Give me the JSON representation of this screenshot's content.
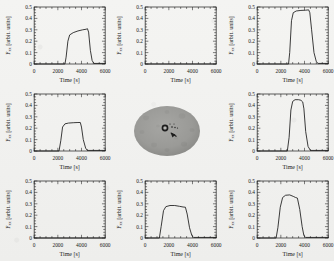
{
  "figure": {
    "kind": "3x3 grid of time-series plots with sample photograph in center",
    "background_color": "#f2f2f0",
    "line_color": "#1a1a1a"
  },
  "axes": {
    "xlabel": "Time [s]",
    "ylabel": "F",
    "ylabel_sub": "xx",
    "ylabel_units": "[arbit. units]",
    "xticks": [
      "0",
      "2000",
      "4000",
      "6000"
    ],
    "yticks": [
      "0",
      "0.1",
      "0.2",
      "0.3",
      "0.4",
      "0.5"
    ],
    "xlim": [
      0,
      6000
    ],
    "ylim": [
      0,
      0.5
    ]
  },
  "sample": {
    "name": "sample-photograph",
    "shape": "ellipse",
    "fill_color": "#9a9a98",
    "marker_color": "#1d1d1d",
    "features": [
      "center-ring",
      "dark-arrow",
      "small-dots"
    ]
  },
  "chart_data": [
    {
      "id": "panel-top-left",
      "position": "row1-col1",
      "type": "line",
      "title": "",
      "xlabel": "Time [s]",
      "ylabel": "F_xx [arbit. units]",
      "xlim": [
        0,
        6000
      ],
      "ylim": [
        0,
        0.5
      ],
      "grid": false,
      "x": [
        0,
        2600,
        2700,
        2850,
        3000,
        3300,
        3700,
        4100,
        4400,
        4500,
        4600,
        4750,
        4900,
        5050,
        6000
      ],
      "y": [
        0,
        0,
        0.06,
        0.2,
        0.255,
        0.275,
        0.29,
        0.3,
        0.305,
        0.31,
        0.28,
        0.12,
        0.03,
        0.005,
        0.005
      ]
    },
    {
      "id": "panel-top-center",
      "position": "row1-col2",
      "type": "line",
      "title": "",
      "xlabel": "Time [s]",
      "ylabel": "F_xx [arbit. units]",
      "xlim": [
        0,
        6000
      ],
      "ylim": [
        0,
        0.5
      ],
      "grid": false,
      "x": [
        0,
        6000
      ],
      "y": [
        0,
        0
      ]
    },
    {
      "id": "panel-top-right",
      "position": "row1-col3",
      "type": "line",
      "title": "",
      "xlabel": "Time [s]",
      "ylabel": "F_xx [arbit. units]",
      "xlim": [
        0,
        6000
      ],
      "ylim": [
        0,
        0.5
      ],
      "grid": false,
      "x": [
        0,
        2650,
        2750,
        2900,
        3050,
        3300,
        3700,
        4100,
        4350,
        4450,
        4600,
        4800,
        5000,
        5150,
        6000
      ],
      "y": [
        0,
        0,
        0.1,
        0.38,
        0.45,
        0.465,
        0.47,
        0.472,
        0.475,
        0.45,
        0.3,
        0.1,
        0.02,
        0.005,
        0.005
      ]
    },
    {
      "id": "panel-middle-left",
      "position": "row2-col1",
      "type": "line",
      "title": "",
      "xlabel": "Time [s]",
      "ylabel": "F_xx [arbit. units]",
      "xlim": [
        0,
        6000
      ],
      "ylim": [
        0,
        0.5
      ],
      "grid": false,
      "x": [
        0,
        2100,
        2250,
        2400,
        2600,
        2900,
        3300,
        3700,
        3900,
        4000,
        4150,
        4350,
        4500,
        6000
      ],
      "y": [
        0,
        0,
        0.09,
        0.21,
        0.238,
        0.245,
        0.248,
        0.25,
        0.25,
        0.21,
        0.1,
        0.025,
        0.005,
        0.005
      ]
    },
    {
      "id": "panel-middle-center",
      "position": "row2-col2",
      "type": "image",
      "title": "sample photograph"
    },
    {
      "id": "panel-middle-right",
      "position": "row2-col3",
      "type": "line",
      "title": "",
      "xlabel": "Time [s]",
      "ylabel": "F_xx [arbit. units]",
      "xlim": [
        0,
        6000
      ],
      "ylim": [
        0,
        0.5
      ],
      "grid": false,
      "x": [
        0,
        2550,
        2700,
        2850,
        3000,
        3200,
        3500,
        3700,
        3850,
        3950,
        4100,
        4300,
        4500,
        6000
      ],
      "y": [
        0,
        0,
        0.12,
        0.36,
        0.435,
        0.45,
        0.45,
        0.445,
        0.43,
        0.37,
        0.17,
        0.04,
        0.005,
        0.005
      ]
    },
    {
      "id": "panel-bottom-left",
      "position": "row3-col1",
      "type": "line",
      "title": "",
      "xlabel": "Time [s]",
      "ylabel": "F_xx [arbit. units]",
      "xlim": [
        0,
        6000
      ],
      "ylim": [
        0,
        0.5
      ],
      "grid": false,
      "x": [
        0,
        6000
      ],
      "y": [
        0,
        0
      ]
    },
    {
      "id": "panel-bottom-center",
      "position": "row3-col2",
      "type": "line",
      "title": "",
      "xlabel": "Time [s]",
      "ylabel": "F_xx [arbit. units]",
      "xlim": [
        0,
        6000
      ],
      "ylim": [
        0,
        0.5
      ],
      "grid": false,
      "x": [
        0,
        1200,
        1350,
        1550,
        1750,
        2100,
        2500,
        2900,
        3200,
        3400,
        3550,
        3750,
        3950,
        4100,
        6000
      ],
      "y": [
        0,
        0,
        0.1,
        0.24,
        0.275,
        0.285,
        0.285,
        0.278,
        0.272,
        0.27,
        0.21,
        0.09,
        0.02,
        0.005,
        0.005
      ]
    },
    {
      "id": "panel-bottom-right",
      "position": "row3-col3",
      "type": "line",
      "title": "",
      "xlabel": "Time [s]",
      "ylabel": "F_xx [arbit. units]",
      "xlim": [
        0,
        6000
      ],
      "ylim": [
        0,
        0.5
      ],
      "grid": false,
      "x": [
        0,
        1600,
        1750,
        1950,
        2150,
        2400,
        2750,
        3050,
        3250,
        3400,
        3600,
        3800,
        3950,
        4100,
        6000
      ],
      "y": [
        0,
        0,
        0.09,
        0.27,
        0.355,
        0.375,
        0.378,
        0.365,
        0.355,
        0.35,
        0.25,
        0.1,
        0.02,
        0.005,
        0.005
      ]
    }
  ]
}
